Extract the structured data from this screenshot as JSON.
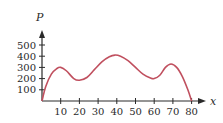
{
  "chart_data": {
    "type": "line",
    "title": "",
    "xlabel": "x",
    "ylabel": "P",
    "xlim": [
      0,
      80
    ],
    "ylim": [
      0,
      500
    ],
    "x_ticks": [
      10,
      20,
      30,
      40,
      50,
      60,
      70,
      80
    ],
    "y_ticks": [
      100,
      200,
      300,
      400,
      500
    ],
    "grid": false,
    "legend": null,
    "series": [
      {
        "name": "P(x)",
        "color": "#c0505f",
        "x": [
          0,
          2,
          5,
          8,
          10,
          13,
          17,
          20,
          24,
          28,
          32,
          36,
          39,
          42,
          46,
          50,
          54,
          58,
          60,
          63,
          66,
          69,
          72,
          75,
          78,
          80
        ],
        "values": [
          0,
          130,
          240,
          290,
          300,
          270,
          200,
          185,
          210,
          280,
          350,
          395,
          410,
          400,
          360,
          300,
          240,
          205,
          200,
          230,
          300,
          330,
          300,
          220,
          100,
          0
        ]
      }
    ]
  },
  "axes": {
    "x_label": "x",
    "y_label": "P",
    "x_tick_labels": [
      "10",
      "20",
      "30",
      "40",
      "50",
      "60",
      "70",
      "80"
    ],
    "y_tick_labels": [
      "100",
      "200",
      "300",
      "400",
      "500"
    ]
  }
}
